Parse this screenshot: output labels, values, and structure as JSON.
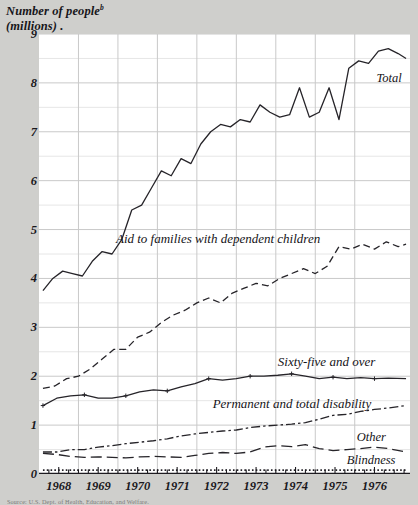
{
  "figure": {
    "y_axis_title_line1": "Number of people",
    "y_axis_title_sup": "b",
    "y_axis_title_line2": "(millions)",
    "caption": "Source: U.S. Dept. of Health, Education, and Welfare."
  },
  "chart_data": {
    "type": "line",
    "xlabel": "",
    "ylabel": "Number of people (millions)",
    "xlim": [
      1967.5,
      1976.9
    ],
    "ylim": [
      0,
      9
    ],
    "yticks": [
      0,
      1,
      2,
      3,
      4,
      5,
      6,
      7,
      8,
      9
    ],
    "ytick_labels": [
      "0",
      "1",
      "2",
      "3",
      "4",
      "5",
      "6",
      "7",
      "8",
      "9"
    ],
    "minor_gridlines": "half-unit",
    "xticks": [
      1968,
      1969,
      1970,
      1971,
      1972,
      1973,
      1974,
      1975,
      1976
    ],
    "xtick_labels": [
      "1968",
      "1969",
      "1970",
      "1971",
      "1972",
      "1973",
      "1974",
      "1975",
      "1976"
    ],
    "x_minor_ticks": "quarterly",
    "grid": true,
    "legend": "inline-labels",
    "series": [
      {
        "name": "Total",
        "label": "Total",
        "style": "solid",
        "color": "#262429",
        "x": [
          1967.6,
          1967.85,
          1968.1,
          1968.35,
          1968.6,
          1968.85,
          1969.1,
          1969.35,
          1969.6,
          1969.85,
          1970.1,
          1970.35,
          1970.6,
          1970.85,
          1971.1,
          1971.35,
          1971.6,
          1971.85,
          1972.1,
          1972.35,
          1972.6,
          1972.85,
          1973.1,
          1973.35,
          1973.6,
          1973.85,
          1974.1,
          1974.35,
          1974.6,
          1974.85,
          1975.1,
          1975.35,
          1975.6,
          1975.85,
          1976.1,
          1976.35,
          1976.6,
          1976.8
        ],
        "y": [
          3.75,
          4.0,
          4.15,
          4.1,
          4.05,
          4.35,
          4.55,
          4.5,
          4.8,
          5.4,
          5.5,
          5.85,
          6.2,
          6.1,
          6.45,
          6.35,
          6.75,
          7.0,
          7.15,
          7.1,
          7.25,
          7.2,
          7.55,
          7.4,
          7.3,
          7.35,
          7.9,
          7.3,
          7.4,
          7.9,
          7.25,
          8.3,
          8.45,
          8.4,
          8.65,
          8.7,
          8.6,
          8.5
        ]
      },
      {
        "name": "Aid to families with dependent children",
        "label": "Aid to families with dependent children",
        "style": "dashed",
        "color": "#262429",
        "x": [
          1967.6,
          1967.9,
          1968.2,
          1968.5,
          1968.8,
          1969.1,
          1969.4,
          1969.7,
          1970.0,
          1970.3,
          1970.6,
          1970.9,
          1971.2,
          1971.5,
          1971.8,
          1972.1,
          1972.4,
          1972.7,
          1973.0,
          1973.3,
          1973.6,
          1973.9,
          1974.2,
          1974.5,
          1974.8,
          1975.1,
          1975.4,
          1975.7,
          1976.0,
          1976.3,
          1976.6,
          1976.8
        ],
        "y": [
          1.75,
          1.8,
          1.95,
          2.0,
          2.15,
          2.35,
          2.55,
          2.55,
          2.8,
          2.9,
          3.1,
          3.25,
          3.35,
          3.5,
          3.6,
          3.5,
          3.7,
          3.8,
          3.9,
          3.85,
          4.0,
          4.1,
          4.2,
          4.1,
          4.25,
          4.65,
          4.6,
          4.7,
          4.6,
          4.75,
          4.65,
          4.7
        ]
      },
      {
        "name": "Sixty-five and over",
        "label": "Sixty-five and over",
        "style": "solid",
        "color": "#262429",
        "x": [
          1967.6,
          1967.95,
          1968.3,
          1968.65,
          1969.0,
          1969.35,
          1969.7,
          1970.05,
          1970.4,
          1970.75,
          1971.1,
          1971.45,
          1971.8,
          1972.15,
          1972.5,
          1972.85,
          1973.2,
          1973.55,
          1973.9,
          1974.25,
          1974.6,
          1974.95,
          1975.3,
          1975.65,
          1976.0,
          1976.35,
          1976.8
        ],
        "y": [
          1.4,
          1.55,
          1.6,
          1.62,
          1.55,
          1.55,
          1.6,
          1.68,
          1.72,
          1.7,
          1.78,
          1.85,
          1.95,
          1.92,
          1.95,
          2.0,
          2.0,
          2.02,
          2.05,
          2.0,
          1.95,
          1.98,
          1.95,
          1.97,
          1.95,
          1.96,
          1.95
        ]
      },
      {
        "name": "Permanent and total disability",
        "label": "Permanent and total disability",
        "style": "dash-dot",
        "color": "#262429",
        "x": [
          1967.6,
          1967.95,
          1968.3,
          1968.65,
          1969.0,
          1969.35,
          1969.7,
          1970.05,
          1970.4,
          1970.75,
          1971.1,
          1971.45,
          1971.8,
          1972.15,
          1972.5,
          1972.85,
          1973.2,
          1973.55,
          1973.9,
          1974.25,
          1974.6,
          1974.95,
          1975.3,
          1975.65,
          1976.0,
          1976.35,
          1976.8
        ],
        "y": [
          0.45,
          0.45,
          0.5,
          0.5,
          0.55,
          0.58,
          0.62,
          0.65,
          0.68,
          0.72,
          0.78,
          0.82,
          0.85,
          0.88,
          0.9,
          0.95,
          0.98,
          1.0,
          1.02,
          1.05,
          1.12,
          1.2,
          1.22,
          1.28,
          1.32,
          1.35,
          1.4
        ]
      },
      {
        "name": "Other",
        "label": "Other",
        "style": "long-dash",
        "color": "#262429",
        "x": [
          1967.6,
          1967.95,
          1968.3,
          1968.65,
          1969.0,
          1969.35,
          1969.7,
          1970.05,
          1970.4,
          1970.75,
          1971.1,
          1971.45,
          1971.8,
          1972.15,
          1972.5,
          1972.85,
          1973.2,
          1973.55,
          1973.9,
          1974.25,
          1974.6,
          1974.95,
          1975.3,
          1975.65,
          1976.0,
          1976.35,
          1976.8
        ],
        "y": [
          0.42,
          0.4,
          0.36,
          0.34,
          0.35,
          0.34,
          0.33,
          0.35,
          0.36,
          0.35,
          0.34,
          0.38,
          0.42,
          0.44,
          0.42,
          0.45,
          0.55,
          0.58,
          0.56,
          0.6,
          0.52,
          0.48,
          0.5,
          0.52,
          0.55,
          0.52,
          0.45
        ]
      },
      {
        "name": "Blindness",
        "label": "Blindness",
        "style": "dotted",
        "color": "#262429",
        "x": [
          1967.6,
          1968.2,
          1968.8,
          1969.4,
          1970.0,
          1970.6,
          1971.2,
          1971.8,
          1972.4,
          1973.0,
          1973.6,
          1974.2,
          1974.8,
          1975.4,
          1976.0,
          1976.8
        ],
        "y": [
          0.08,
          0.08,
          0.08,
          0.08,
          0.08,
          0.08,
          0.08,
          0.08,
          0.08,
          0.08,
          0.08,
          0.08,
          0.08,
          0.08,
          0.08,
          0.08
        ]
      }
    ],
    "series_label_positions": [
      {
        "name": "Total",
        "x": 1976.05,
        "y": 8.05
      },
      {
        "name": "Aid to families with dependent children",
        "x": 1969.45,
        "y": 4.78
      },
      {
        "name": "Sixty-five and over",
        "x": 1973.55,
        "y": 2.28
      },
      {
        "name": "Permanent and total disability",
        "x": 1971.9,
        "y": 1.42
      },
      {
        "name": "Other",
        "x": 1975.55,
        "y": 0.72
      },
      {
        "name": "Blindness",
        "x": 1975.3,
        "y": 0.25
      }
    ]
  }
}
